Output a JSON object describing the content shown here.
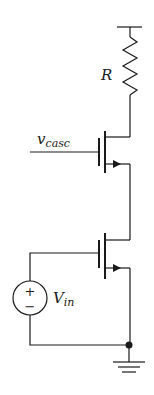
{
  "diagram": {
    "type": "cascode-amplifier-schematic",
    "components": {
      "resistor": {
        "label": "R"
      },
      "cascode_transistor": {
        "gate_label_main": "v",
        "gate_label_sub": "casc"
      },
      "input_transistor": {},
      "voltage_source": {
        "label_main": "V",
        "label_sub": "in",
        "plus": "+",
        "minus": "−"
      },
      "ground": {}
    },
    "colors": {
      "ink": "#1a1a1a",
      "background": "#ffffff"
    }
  }
}
